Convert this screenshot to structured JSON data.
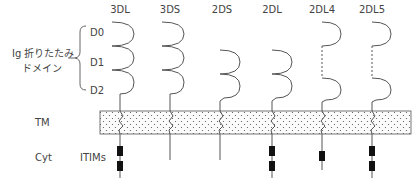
{
  "diagram": {
    "domain_group_label_line1": "Ig 折りたたみ",
    "domain_group_label_line2": "ドメイン",
    "domain_labels": [
      "D0",
      "D1",
      "D2"
    ],
    "region_labels": {
      "tm": "TM",
      "cyt": "Cyt",
      "itims": "ITIMs"
    },
    "columns": [
      {
        "name": "3DL",
        "x": 120,
        "domains": [
          "D0",
          "D1",
          "D2"
        ],
        "itims": 2,
        "cyt_tail": "long"
      },
      {
        "name": "3DS",
        "x": 170,
        "domains": [
          "D0",
          "D1",
          "D2"
        ],
        "itims": 0,
        "cyt_tail": "short"
      },
      {
        "name": "2DS",
        "x": 220,
        "domains": [
          "D1",
          "D2"
        ],
        "itims": 0,
        "cyt_tail": "short"
      },
      {
        "name": "2DL",
        "x": 272,
        "domains": [
          "D1",
          "D2"
        ],
        "itims": 2,
        "cyt_tail": "long"
      },
      {
        "name": "2DL4",
        "x": 322,
        "domains": [
          "D0",
          "D2"
        ],
        "itims": 1,
        "cyt_tail": "long"
      },
      {
        "name": "2DL5",
        "x": 372,
        "domains": [
          "D0",
          "D2"
        ],
        "itims": 2,
        "cyt_tail": "long"
      }
    ]
  }
}
